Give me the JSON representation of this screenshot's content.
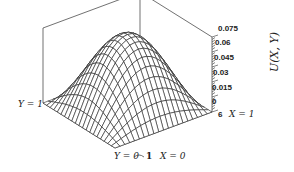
{
  "chart_data": {
    "type": "surface",
    "title": "",
    "zlabel": "U(X, Y)",
    "x_range": [
      0,
      1
    ],
    "y_range": [
      0,
      1
    ],
    "zlim": [
      0,
      0.075
    ],
    "z_ticks": [
      "0.075",
      "0.06",
      "0.045",
      "0.03",
      "0.015",
      "0",
      "6"
    ],
    "peak_value": 0.073,
    "peak_location": {
      "X": 0.5,
      "Y": 0.5
    },
    "grid_lines": 21,
    "surface_shape": "sin(pi X) sin(pi Y) dome, zero on boundary",
    "corner_labels": {
      "y1": "Y = 1",
      "y0": "Y = 0",
      "x0": "X = 0",
      "x1": "X = 1",
      "one": "1"
    },
    "colors": {
      "line": "#2a2a2a",
      "background": "#ffffff"
    }
  }
}
